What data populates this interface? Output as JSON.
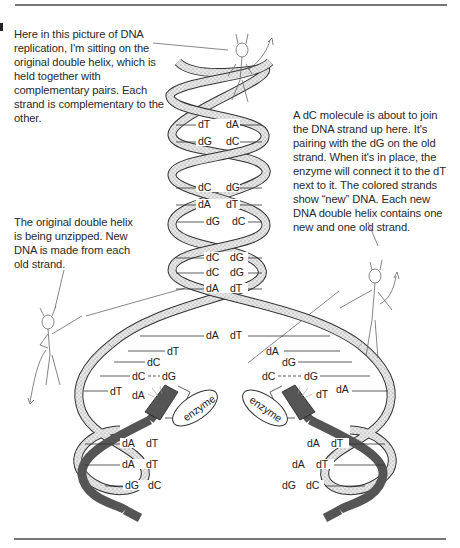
{
  "figure": {
    "colors": {
      "old_strand": "#e2e2e2",
      "old_strand_edge": "#333333",
      "new_strand": "#555555",
      "rule": "#777777",
      "text": "#2a2a2a"
    }
  },
  "captions": {
    "top_left": "Here in this picture of DNA replication, I'm sitting on the original double helix, which is held together with complementary pairs. Each strand is complementary to the other.",
    "right": "A dC molecule is about to join the DNA strand up here. It's pairing with the dG on the old strand. When it's in place, the enzyme will connect it to the dT next to it. The colored strands show “new” DNA. Each new DNA double helix contains one new and one old strand.",
    "left_middle": "The original double helix is being unzipped. New DNA is made from each old strand."
  },
  "helix": {
    "original_pairs": [
      {
        "left": "dT",
        "right": "dA"
      },
      {
        "left": "dG",
        "right": "dC"
      },
      {
        "left": "dC",
        "right": "dG"
      },
      {
        "left": "dA",
        "right": "dT"
      },
      {
        "left": "dG",
        "right": "dC"
      },
      {
        "left": "dC",
        "right": "dG"
      },
      {
        "left": "dC",
        "right": "dG"
      },
      {
        "left": "dA",
        "right": "dT"
      },
      {
        "left": "dA",
        "right": "dT"
      }
    ],
    "fork_left": {
      "unpaired": [
        "dT",
        "dC"
      ],
      "pairing": {
        "left": "dC",
        "right": "dG"
      },
      "incoming": {
        "left": "dT",
        "right": "dA"
      },
      "enzyme": "enzyme",
      "new_pairs": [
        {
          "left": "dA",
          "right": "dT"
        },
        {
          "left": "dA",
          "right": "dT"
        },
        {
          "left": "dG",
          "right": "dC"
        }
      ]
    },
    "fork_right": {
      "unpaired": [
        "dA",
        "dG"
      ],
      "pairing": {
        "left": "dC",
        "right": "dG"
      },
      "incoming": {
        "left": "dT",
        "right": "dA"
      },
      "enzyme": "enzyme",
      "new_pairs": [
        {
          "left": "dA",
          "right": "dT"
        },
        {
          "left": "dA",
          "right": "dT"
        },
        {
          "left": "dG",
          "right": "dC"
        }
      ]
    }
  }
}
